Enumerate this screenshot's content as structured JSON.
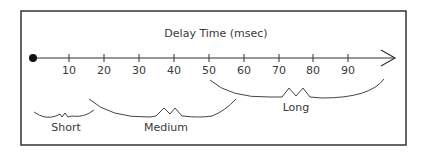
{
  "diagram": {
    "title": "Delay Time (msec)",
    "axis": {
      "ticks": [
        {
          "label": "10",
          "x": 69
        },
        {
          "label": "20",
          "x": 104
        },
        {
          "label": "30",
          "x": 139
        },
        {
          "label": "40",
          "x": 174
        },
        {
          "label": "50",
          "x": 209
        },
        {
          "label": "60",
          "x": 244
        },
        {
          "label": "70",
          "x": 279
        },
        {
          "label": "80",
          "x": 313
        },
        {
          "label": "90",
          "x": 348
        }
      ]
    },
    "ranges": [
      {
        "label": "Short",
        "from": 0,
        "to": 20
      },
      {
        "label": "Medium",
        "from": 15,
        "to": 60
      },
      {
        "label": "Long",
        "from": 50,
        "to": 100
      }
    ],
    "colors": {
      "stroke": "#333333",
      "text": "#3a3a3a",
      "background": "#ffffff"
    }
  }
}
